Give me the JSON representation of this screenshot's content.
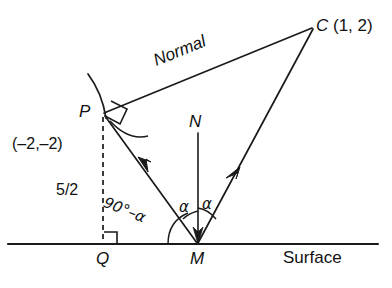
{
  "figure": {
    "stroke_color": "#1a1a1a",
    "background": "#ffffff"
  },
  "labels": {
    "point_c": "C (1, 2)",
    "point_c_letter": "C",
    "point_p": "P",
    "point_p_coords": "(–2,–2)",
    "segment_pq_length": "5/2",
    "point_q": "Q",
    "point_m": "M",
    "point_n": "N",
    "normal_line": "Normal",
    "surface": "Surface",
    "angle_incidence": "α",
    "angle_reflection": "α",
    "angle_pq_with_ray": "90°–α"
  },
  "geometry": {
    "points": {
      "P": [
        103,
        112
      ],
      "Q": [
        103,
        244
      ],
      "M": [
        198,
        244
      ],
      "C": [
        313,
        27
      ],
      "N_top": [
        198,
        132
      ]
    },
    "surface_line": {
      "x1": 8,
      "y1": 244,
      "x2": 378,
      "y2": 244
    },
    "segments": [
      {
        "name": "normal-PC",
        "from": "P",
        "to": "C"
      },
      {
        "name": "incident-ray-PM",
        "from": "P",
        "to": "M"
      },
      {
        "name": "reflected-ray-MC",
        "from": "M",
        "to": "C"
      },
      {
        "name": "normal-at-M",
        "from": "N_top",
        "to": "M"
      },
      {
        "name": "perpendicular-PQ",
        "from": "P",
        "to": "Q",
        "style": "dashed"
      }
    ],
    "arrow_markers": [
      {
        "name": "incident-ray-arrow",
        "on": "incident-ray-PM",
        "direction": "toward-M"
      },
      {
        "name": "reflected-ray-arrow",
        "on": "reflected-ray-MC",
        "direction": "toward-C"
      },
      {
        "name": "normal-at-M-arrow",
        "on": "normal-at-M",
        "direction": "toward-M"
      }
    ],
    "right_angle_marks": [
      {
        "name": "right-angle-at-P",
        "at": "P"
      },
      {
        "name": "right-angle-at-Q",
        "at": "Q"
      }
    ],
    "arcs": [
      {
        "name": "mirror-surface-arc",
        "near": "P"
      },
      {
        "name": "angle-arc-at-P",
        "near": "P"
      },
      {
        "name": "angle-arc-incidence",
        "near": "M"
      },
      {
        "name": "angle-arc-reflection",
        "near": "M"
      },
      {
        "name": "angle-arc-90-minus-alpha",
        "near": "M"
      }
    ]
  }
}
